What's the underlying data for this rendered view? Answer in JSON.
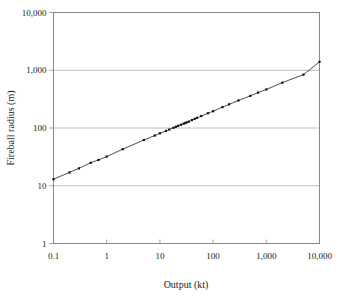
{
  "chart_data": {
    "type": "line",
    "title": "",
    "xlabel": "Output (kt)",
    "ylabel": "Fireball radius (m)",
    "xscale": "log",
    "yscale": "log",
    "xlim": [
      0.1,
      10000
    ],
    "ylim": [
      1,
      10000
    ],
    "grid": "horizontal",
    "legend": "none",
    "xticklabels": [
      "0.1",
      "1",
      "10",
      "100",
      "1,000",
      "10,000"
    ],
    "xtickvalues": [
      0.1,
      1,
      10,
      100,
      1000,
      10000
    ],
    "yticklabels": [
      "1",
      "10",
      "100",
      "1,000",
      "10,000"
    ],
    "ytickvalues": [
      1,
      10,
      100,
      1000,
      10000
    ],
    "series": [
      {
        "name": "Fireball radius",
        "x": [
          0.1,
          0.2,
          0.3,
          0.5,
          0.7,
          1,
          2,
          5,
          8,
          10,
          13,
          15,
          18,
          20,
          22,
          25,
          28,
          30,
          32,
          35,
          40,
          45,
          50,
          60,
          80,
          100,
          150,
          200,
          300,
          500,
          700,
          1000,
          2000,
          5000,
          10000
        ],
        "y": [
          13,
          17,
          20,
          25,
          28,
          32,
          43,
          62,
          74,
          81,
          89,
          94,
          101,
          105,
          109,
          114,
          119,
          122,
          125,
          129,
          137,
          144,
          150,
          161,
          180,
          195,
          230,
          257,
          300,
          360,
          410,
          465,
          610,
          840,
          1400
        ],
        "marker": "dot",
        "linestyle": "solid"
      }
    ]
  },
  "axes": {
    "x_title": "Output (kt)",
    "y_title": "Fireball radius (m)"
  }
}
